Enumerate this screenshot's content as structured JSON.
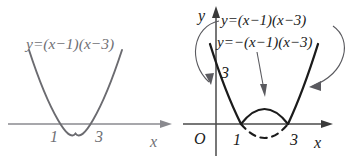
{
  "figure": {
    "colors": {
      "left_curve": "#6b6b70",
      "left_axis": "#8a8a8f",
      "left_text": "#6f6f74",
      "right_curve": "#1b1b1b",
      "right_axis": "#4a4a4a",
      "right_text": "#1b1b1b",
      "arrow": "#5a5a5f",
      "background": "#ffffff"
    }
  },
  "left_panel": {
    "name": "original-parabola-graph",
    "equation_label": "y=(x−1)(x−3)",
    "axis_x_label": "x",
    "tick_labels": [
      "1",
      "3"
    ],
    "roots": [
      1,
      3
    ],
    "has_y_axis": false,
    "curve_style": "solid"
  },
  "right_panel": {
    "name": "parabola-with-reflection-graph",
    "equation_label_upper": "y=(x−1)(x−3)",
    "equation_label_lower": "y=−(x−1)(x−3)",
    "axis_x_label": "x",
    "axis_y_label": "y",
    "origin_label": "O",
    "y_intercept_label": "3",
    "tick_labels": [
      "1",
      "3"
    ],
    "roots": [
      1,
      3
    ],
    "upper_arc_style": "solid",
    "lower_arc_style": "dashed",
    "annotation_arrows": [
      {
        "name": "left-curved-arrow",
        "points_to": "left-branch-of-parabola"
      },
      {
        "name": "center-straight-arrow",
        "points_to": "upper-solid-arc"
      },
      {
        "name": "right-curved-arrow",
        "points_to": "right-branch-of-parabola"
      }
    ]
  }
}
